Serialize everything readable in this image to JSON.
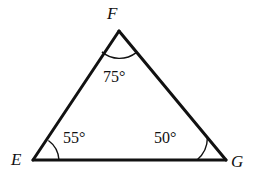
{
  "figure": {
    "kind": "geometry-diagram",
    "shape_name": "triangle",
    "background_color": "#ffffff",
    "stroke_color": "#111111",
    "edge_stroke_width": 3,
    "arc_stroke_width": 1.4,
    "width": 256,
    "height": 185
  },
  "vertices": [
    {
      "id": "E",
      "label": "E",
      "x": 33,
      "y": 160,
      "label_x": 11,
      "label_y": 151
    },
    {
      "id": "F",
      "label": "F",
      "x": 119,
      "y": 31,
      "label_x": 107,
      "label_y": 5
    },
    {
      "id": "G",
      "label": "G",
      "x": 226,
      "y": 160,
      "label_x": 231,
      "label_y": 153
    }
  ],
  "edges": [
    {
      "id": "EF",
      "from": "E",
      "to": "F"
    },
    {
      "id": "FG",
      "from": "F",
      "to": "G"
    },
    {
      "id": "EG",
      "from": "E",
      "to": "G"
    }
  ],
  "angles": [
    {
      "id": "angle-E",
      "vertex": "E",
      "value": 55,
      "label": "55°",
      "arc_radius": 26,
      "label_x": 63,
      "label_y": 130
    },
    {
      "id": "angle-F",
      "vertex": "F",
      "value": 75,
      "label": "75°",
      "arc_radius": 27,
      "label_x": 103,
      "label_y": 69
    },
    {
      "id": "angle-G",
      "vertex": "G",
      "value": 50,
      "label": "50°",
      "arc_radius": 29,
      "label_x": 154,
      "label_y": 130
    }
  ],
  "labels": {
    "vertex_E": "E",
    "vertex_F": "F",
    "vertex_G": "G",
    "angle_E": "55°",
    "angle_F": "75°",
    "angle_G": "50°"
  }
}
